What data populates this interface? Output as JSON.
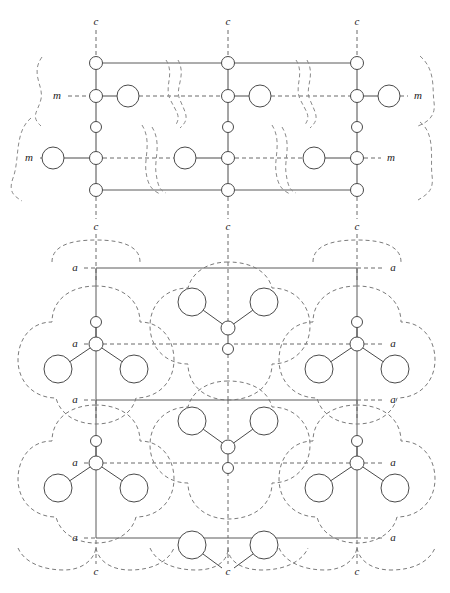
{
  "figure": {
    "width": 450,
    "height": 593,
    "background_color": "#ffffff",
    "line_color": "#4a4a4a",
    "dash_color": "#7a7a7a"
  },
  "labels": {
    "c_axis": "c",
    "m_mirror": "m",
    "a_axis": "a"
  },
  "top_panel": {
    "name": "bonded-network-panel",
    "c_labels_top": [
      {
        "text": "c",
        "x": 96,
        "y": 22
      },
      {
        "text": "c",
        "x": 228,
        "y": 22
      },
      {
        "text": "c",
        "x": 357,
        "y": 22
      }
    ],
    "c_labels_bottom": [
      {
        "text": "c",
        "x": 96,
        "y": 227
      },
      {
        "text": "c",
        "x": 228,
        "y": 227
      },
      {
        "text": "c",
        "x": 357,
        "y": 227
      }
    ],
    "m_labels": [
      {
        "text": "m",
        "x": 57,
        "y": 96
      },
      {
        "text": "m",
        "x": 418,
        "y": 96
      },
      {
        "text": "m",
        "x": 29,
        "y": 158
      },
      {
        "text": "m",
        "x": 391,
        "y": 158
      }
    ],
    "columns_x": [
      96,
      228,
      357
    ],
    "chain_node_y": [
      63,
      96,
      127,
      158,
      190
    ],
    "small_radius": 6.5,
    "medium_radius": 5.5,
    "large_radius": 11,
    "horizontal_frame_y": [
      63,
      190
    ],
    "mirror_rows_y": [
      96,
      158
    ],
    "large_circle_offset": 32
  },
  "bottom_panel": {
    "name": "vdw-envelope-panel",
    "a_labels_left": [
      {
        "text": "a",
        "x": 75,
        "y": 268
      },
      {
        "text": "a",
        "x": 75,
        "y": 344
      },
      {
        "text": "a",
        "x": 75,
        "y": 400
      },
      {
        "text": "a",
        "x": 75,
        "y": 463
      },
      {
        "text": "a",
        "x": 75,
        "y": 538
      }
    ],
    "a_labels_right": [
      {
        "text": "a",
        "x": 393,
        "y": 268
      },
      {
        "text": "a",
        "x": 393,
        "y": 344
      },
      {
        "text": "a",
        "x": 393,
        "y": 400
      },
      {
        "text": "a",
        "x": 393,
        "y": 463
      },
      {
        "text": "a",
        "x": 393,
        "y": 538
      }
    ],
    "c_labels_bottom": [
      {
        "text": "c",
        "x": 96,
        "y": 572
      },
      {
        "text": "c",
        "x": 228,
        "y": 572
      },
      {
        "text": "c",
        "x": 357,
        "y": 572
      }
    ],
    "columns_x": [
      96,
      228,
      357
    ],
    "frame_rows_y": [
      268,
      400,
      538
    ],
    "mirror_rows_y": [
      344,
      463
    ],
    "small_radius": 6.5,
    "tiny_radius": 5.5,
    "large_radius": 14,
    "arm_dx": 37,
    "arm_dy": 24
  },
  "legend": {
    "atom_small": "small-atom-node",
    "atom_large": "large-atom-node",
    "bond": "covalent-bond",
    "envelope": "van-der-waals-envelope",
    "axis": "crystal-axis-trace"
  }
}
